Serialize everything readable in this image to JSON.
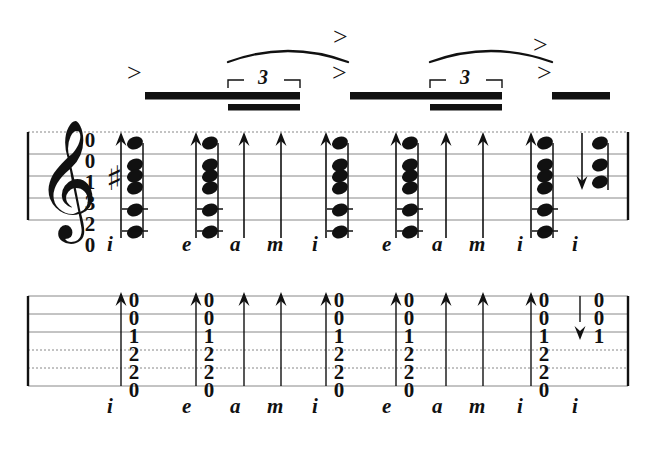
{
  "document": {
    "type": "guitar-music-notation",
    "systems": [
      "standard-notation-staff",
      "tablature-staff"
    ],
    "clef": "treble",
    "key_signature": "one-sharp",
    "ink_color": "#111111",
    "paper_color": "#ffffff",
    "stave_line_color": "#888888"
  },
  "notation": {
    "clef_glyph": "𝄞",
    "sharp_glyph": "♯",
    "accent_glyph": ">",
    "triplet_label": "3",
    "arrow_up_name": "arpeggio-up-arrow",
    "arrow_down_name": "arpeggio-down-arrow"
  },
  "left_fret_column": {
    "label": "left-hand-fret-numbers",
    "values": [
      "0",
      "0",
      "1",
      "3",
      "2",
      "0"
    ]
  },
  "events": [
    {
      "id": "ev1",
      "finger": "i",
      "x": 135,
      "stroke": "up",
      "accent": true,
      "chord": true,
      "tab_frets": [
        "0",
        "0",
        "1",
        "2",
        "2",
        "0"
      ],
      "note_count": 6
    },
    {
      "id": "ev2",
      "finger": "e",
      "x": 210,
      "stroke": "up",
      "accent": false,
      "chord": true,
      "tab_frets": [
        "0",
        "0",
        "1",
        "2",
        "2",
        "0"
      ],
      "note_count": 6
    },
    {
      "id": "ev3",
      "finger": "a",
      "x": 258,
      "stroke": "up",
      "accent": false,
      "chord": false,
      "tab_frets": [],
      "note_count": 0
    },
    {
      "id": "ev4",
      "finger": "m",
      "x": 295,
      "stroke": "up",
      "accent": false,
      "chord": false,
      "tab_frets": [],
      "note_count": 0
    },
    {
      "id": "ev5",
      "finger": "i",
      "x": 340,
      "stroke": "up",
      "accent": true,
      "chord": true,
      "tab_frets": [
        "0",
        "0",
        "1",
        "2",
        "2",
        "0"
      ],
      "note_count": 6
    },
    {
      "id": "ev6",
      "finger": "e",
      "x": 410,
      "stroke": "up",
      "accent": false,
      "chord": true,
      "tab_frets": [
        "0",
        "0",
        "1",
        "2",
        "2",
        "0"
      ],
      "note_count": 6
    },
    {
      "id": "ev7",
      "finger": "a",
      "x": 460,
      "stroke": "up",
      "accent": false,
      "chord": false,
      "tab_frets": [],
      "note_count": 0
    },
    {
      "id": "ev8",
      "finger": "m",
      "x": 497,
      "stroke": "up",
      "accent": false,
      "chord": false,
      "tab_frets": [],
      "note_count": 0
    },
    {
      "id": "ev9",
      "finger": "i",
      "x": 545,
      "stroke": "up",
      "accent": true,
      "chord": true,
      "tab_frets": [
        "0",
        "0",
        "1",
        "2",
        "2",
        "0"
      ],
      "note_count": 6
    },
    {
      "id": "ev10",
      "finger": "i",
      "x": 600,
      "stroke": "down",
      "accent": false,
      "chord": true,
      "tab_frets": [
        "0",
        "0",
        "1"
      ],
      "note_count": 3
    }
  ],
  "beams": [
    {
      "id": "beam1",
      "x1": 145,
      "x2": 300,
      "secondary_x1": 228,
      "secondary_x2": 300
    },
    {
      "id": "beam2",
      "x1": 350,
      "x2": 502,
      "secondary_x1": 430,
      "secondary_x2": 502
    },
    {
      "id": "beam3",
      "x1": 552,
      "x2": 610,
      "secondary_x1": null,
      "secondary_x2": null
    }
  ],
  "triplets": [
    {
      "id": "trip1",
      "x1": 228,
      "x2": 300,
      "label": "3"
    },
    {
      "id": "trip2",
      "x1": 430,
      "x2": 502,
      "label": "3"
    }
  ],
  "slurs": [
    {
      "id": "slur1",
      "x1": 228,
      "x2": 348
    },
    {
      "id": "slur2",
      "x1": 430,
      "x2": 552
    }
  ],
  "accents": [
    {
      "id": "acc1",
      "x": 135
    },
    {
      "id": "acc2",
      "x": 340
    },
    {
      "id": "acc3",
      "x": 545
    }
  ],
  "fingering_row_staff": [
    "i",
    "e",
    "a",
    "m",
    "i",
    "e",
    "a",
    "m",
    "i",
    "i"
  ],
  "fingering_row_tab": [
    "i",
    "e",
    "a",
    "m",
    "i",
    "e",
    "a",
    "m",
    "i",
    "i"
  ]
}
